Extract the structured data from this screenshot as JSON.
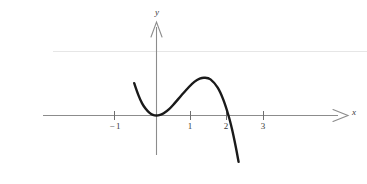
{
  "chart_data": {
    "type": "line",
    "title": "",
    "subtitle": "",
    "xlabel": "x",
    "ylabel": "y",
    "xlim": [
      -1.25,
      3.9
    ],
    "ylim": [
      -2.6,
      2.3
    ],
    "grid": false,
    "legend": null,
    "x_ticks": [
      -1,
      1,
      2,
      3
    ],
    "x_tick_labels": [
      "−1",
      "1",
      "2",
      "3"
    ],
    "y_ticks": [],
    "y_tick_labels": [],
    "annotations": [],
    "series": [
      {
        "name": "cubic-curve",
        "color": "#1a1a1a",
        "expression": "y = x^2(2 - x)",
        "x_domain": [
          -0.62,
          2.28
        ],
        "points": [
          {
            "x": -0.62,
            "y": 1.01
          },
          {
            "x": -0.5,
            "y": 0.63
          },
          {
            "x": -0.4,
            "y": 0.38
          },
          {
            "x": -0.3,
            "y": 0.21
          },
          {
            "x": -0.2,
            "y": 0.09
          },
          {
            "x": -0.1,
            "y": 0.02
          },
          {
            "x": 0.0,
            "y": 0.0
          },
          {
            "x": 0.1,
            "y": 0.02
          },
          {
            "x": 0.2,
            "y": 0.07
          },
          {
            "x": 0.35,
            "y": 0.2
          },
          {
            "x": 0.5,
            "y": 0.38
          },
          {
            "x": 0.7,
            "y": 0.64
          },
          {
            "x": 0.9,
            "y": 0.89
          },
          {
            "x": 1.05,
            "y": 1.05
          },
          {
            "x": 1.2,
            "y": 1.15
          },
          {
            "x": 1.33,
            "y": 1.18
          },
          {
            "x": 1.5,
            "y": 1.13
          },
          {
            "x": 1.7,
            "y": 0.87
          },
          {
            "x": 1.85,
            "y": 0.51
          },
          {
            "x": 2.0,
            "y": 0.0
          },
          {
            "x": 2.1,
            "y": -0.44
          },
          {
            "x": 2.2,
            "y": -0.97
          },
          {
            "x": 2.28,
            "y": -1.45
          }
        ]
      }
    ],
    "reference_lines": [
      {
        "name": "faint-horizontal-rule",
        "orientation": "horizontal",
        "y": 1.57,
        "color": "#e3e3e3"
      }
    ],
    "axes": {
      "x_axis": {
        "name": "x-axis",
        "color": "#8c8c8c",
        "arrow": true
      },
      "y_axis": {
        "name": "y-axis",
        "color": "#8c8c8c",
        "arrow": true
      }
    }
  },
  "labels": {
    "x_axis_label": "x",
    "y_axis_label": "y",
    "tick_minus": "−",
    "tick_neg1_digit": "1",
    "tick_1": "1",
    "tick_2": "2",
    "tick_3": "3"
  },
  "colors": {
    "background": "#ffffff",
    "curve": "#1a1a1a",
    "axis": "#8c8c8c",
    "tick": "#6e6e6e",
    "text": "#3a3a3a",
    "faint_rule": "#e3e3e3"
  }
}
